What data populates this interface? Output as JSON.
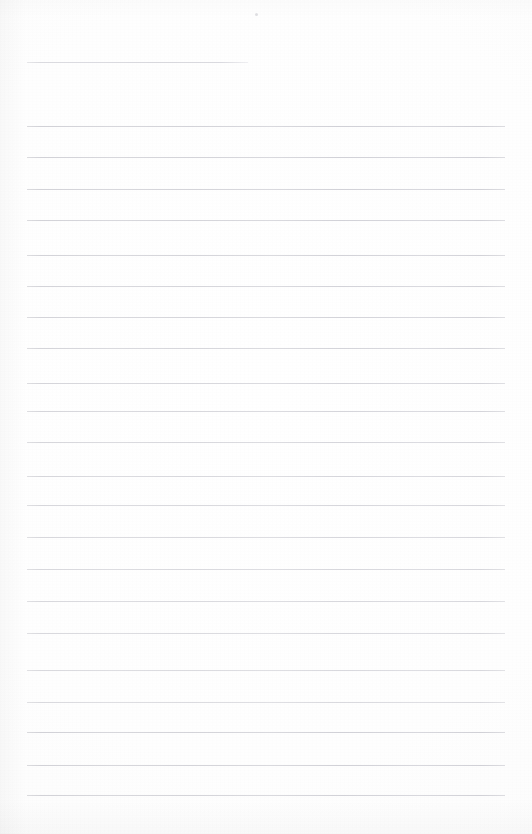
{
  "document": {
    "kind": "ruled-notepad-page",
    "title": "Blank Ruled Notepad Page",
    "description": "Scanned blank lined writing paper with a short header rule and evenly spaced horizontal ruled lines.",
    "page_width": 532,
    "page_height": 834,
    "background_color": "#fefefe",
    "rule_color": "#d6d6da",
    "rule_thickness": 1,
    "content_text": ""
  },
  "layout": {
    "margin_left": 27,
    "margin_right": 505,
    "line_spacing": 31.2,
    "first_line_y": 126,
    "last_line_y": 795,
    "line_count": 22
  },
  "header_rule": {
    "label": "header-rule",
    "x_start": 27,
    "x_end": 248,
    "y": 62,
    "width": 221
  },
  "ruled_lines": [
    {
      "index": 1,
      "y": 126,
      "x_start": 27,
      "x_end": 505
    },
    {
      "index": 2,
      "y": 157,
      "x_start": 27,
      "x_end": 505
    },
    {
      "index": 3,
      "y": 189,
      "x_start": 27,
      "x_end": 505
    },
    {
      "index": 4,
      "y": 220,
      "x_start": 27,
      "x_end": 505
    },
    {
      "index": 5,
      "y": 255,
      "x_start": 27,
      "x_end": 505
    },
    {
      "index": 6,
      "y": 286,
      "x_start": 27,
      "x_end": 505
    },
    {
      "index": 7,
      "y": 317,
      "x_start": 27,
      "x_end": 505
    },
    {
      "index": 8,
      "y": 348,
      "x_start": 27,
      "x_end": 505
    },
    {
      "index": 9,
      "y": 383,
      "x_start": 27,
      "x_end": 505
    },
    {
      "index": 10,
      "y": 411,
      "x_start": 27,
      "x_end": 505
    },
    {
      "index": 11,
      "y": 442,
      "x_start": 27,
      "x_end": 505
    },
    {
      "index": 12,
      "y": 476,
      "x_start": 27,
      "x_end": 505
    },
    {
      "index": 13,
      "y": 505,
      "x_start": 27,
      "x_end": 505
    },
    {
      "index": 14,
      "y": 537,
      "x_start": 27,
      "x_end": 505
    },
    {
      "index": 15,
      "y": 569,
      "x_start": 27,
      "x_end": 505
    },
    {
      "index": 16,
      "y": 601,
      "x_start": 27,
      "x_end": 505
    },
    {
      "index": 17,
      "y": 633,
      "x_start": 27,
      "x_end": 505
    },
    {
      "index": 18,
      "y": 670,
      "x_start": 27,
      "x_end": 505
    },
    {
      "index": 19,
      "y": 702,
      "x_start": 27,
      "x_end": 505
    },
    {
      "index": 20,
      "y": 732,
      "x_start": 27,
      "x_end": 505
    },
    {
      "index": 21,
      "y": 765,
      "x_start": 27,
      "x_end": 505
    },
    {
      "index": 22,
      "y": 795,
      "x_start": 27,
      "x_end": 505
    }
  ],
  "artifacts": [
    {
      "name": "scan-speck",
      "x": 255,
      "y": 13,
      "size": 3
    }
  ]
}
